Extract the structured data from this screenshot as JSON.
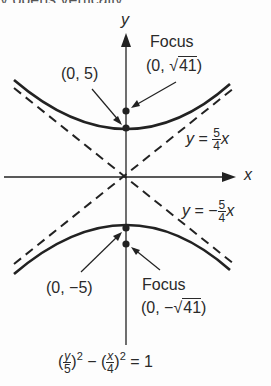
{
  "diagram": {
    "type": "hyperbola",
    "top_cutoff_text": "y opens vertically …",
    "axes": {
      "x_label": "x",
      "y_label": "y"
    },
    "vertices": [
      {
        "label": "(0, 5)"
      },
      {
        "label": "(0, −5)"
      }
    ],
    "foci": [
      {
        "title": "Focus",
        "coord_prefix": "(0, ",
        "radicand": "41",
        "coord_suffix": ")"
      },
      {
        "title": "Focus",
        "coord_prefix": "(0, −",
        "radicand": "41",
        "coord_suffix": ")"
      }
    ],
    "asymptotes": [
      {
        "lhs": "y",
        "eq": "=",
        "sign": "",
        "num": "5",
        "den": "4",
        "var": "x"
      },
      {
        "lhs": "y",
        "eq": "=",
        "sign": "−",
        "num": "5",
        "den": "4",
        "var": "x"
      }
    ],
    "equation": {
      "term1_num": "y",
      "term1_den": "5",
      "term2_num": "x",
      "term2_den": "4",
      "exponent": "2",
      "minus": "−",
      "rhs": "= 1"
    },
    "colors": {
      "line": "#222222",
      "background": "#fdfdfd"
    }
  }
}
